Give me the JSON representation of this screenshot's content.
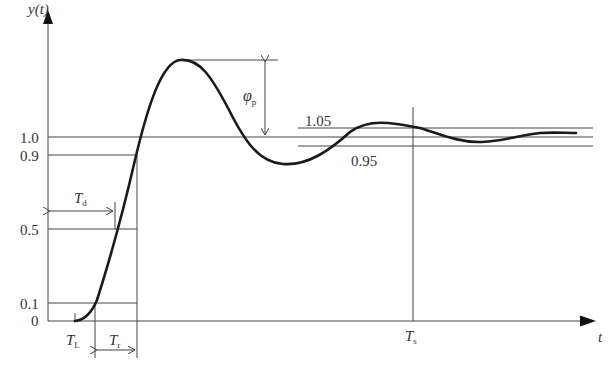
{
  "diagram": {
    "axes": {
      "y_label": "y(t)",
      "x_label": "t"
    },
    "y_ticks": [
      {
        "label": "1.0",
        "value": 1.0
      },
      {
        "label": "0.9",
        "value": 0.9
      },
      {
        "label": "0.5",
        "value": 0.5
      },
      {
        "label": "0.1",
        "value": 0.1
      },
      {
        "label": "0",
        "value": 0
      }
    ],
    "tolerance_band": {
      "upper_label": "1.05",
      "lower_label": "0.95"
    },
    "annotations": {
      "overshoot": {
        "symbol": "φ",
        "subscript": "p"
      },
      "delay_time": {
        "symbol": "T",
        "subscript": "d"
      },
      "lag_time": {
        "symbol": "T",
        "subscript": "L"
      },
      "rise_time": {
        "symbol": "T",
        "subscript": "r"
      },
      "settling_time": {
        "symbol": "T",
        "subscript": "s"
      }
    },
    "colors": {
      "curve": "#1a1a1a",
      "lines": "#444444",
      "text": "#333333"
    }
  }
}
